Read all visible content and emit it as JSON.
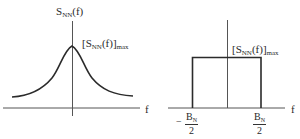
{
  "figure": {
    "panels": [
      {
        "id": "left",
        "shape": "bell-shaped (Lorentzian-like) power spectral density",
        "y_label": {
          "main": "S",
          "sub": "NN",
          "rest": "(f)"
        },
        "peak_label": {
          "open": "[S",
          "sub": "NN",
          "mid": "(f)]",
          "max_sub": "max"
        },
        "x_label": "f"
      },
      {
        "id": "right",
        "shape": "rectangular (ideal band-limited) power spectral density",
        "peak_label": {
          "open": "[S",
          "sub": "NN",
          "mid": "(f)]",
          "max_sub": "max"
        },
        "x_label": "f",
        "left_edge": {
          "sign": "−",
          "num_main": "B",
          "num_sub": "N",
          "den": "2"
        },
        "right_edge": {
          "num_main": "B",
          "num_sub": "N",
          "den": "2"
        }
      }
    ],
    "colors": {
      "line": "#333333",
      "curve": "#2b2b2b",
      "background": "#ffffff"
    }
  }
}
